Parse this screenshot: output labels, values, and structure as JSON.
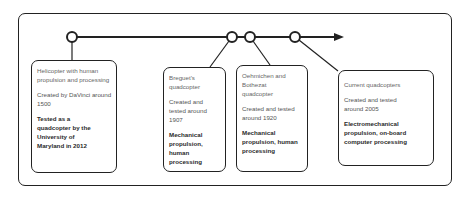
{
  "timeline": {
    "direction": "left-to-right",
    "events": [
      {
        "title": "Helicopter with human propulsion and processing",
        "created": "Created by DaVinci around 1500",
        "note": "Tested as a quadcopter by the University of Maryland in 2012"
      },
      {
        "title": "Breguet's quadcopter",
        "created": "Created and tested around 1907",
        "note": "Mechanical propulsion, human processing"
      },
      {
        "title": "Oehmichen and Bothezat quadcopter",
        "created": "Created and tested around 1920",
        "note": "Mechanical propulsion, human processing"
      },
      {
        "title": "Current quadcopters",
        "created": "Created and tested around 2005",
        "note": "Electromechanical propulsion, on-board computer processing"
      }
    ]
  },
  "colors": {
    "stroke": "#222222",
    "background": "#ffffff",
    "text": "#555555",
    "bold_text": "#2a2a2a"
  }
}
